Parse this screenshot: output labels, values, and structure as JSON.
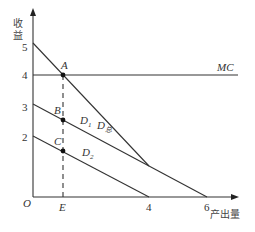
{
  "diagram": {
    "y_axis_label": [
      "收",
      "益"
    ],
    "x_axis_label": "产出量",
    "origin_label": "O",
    "y_ticks": [
      {
        "label": "5",
        "value": 5
      },
      {
        "label": "4",
        "value": 4
      },
      {
        "label": "3",
        "value": 3
      },
      {
        "label": "2",
        "value": 2
      }
    ],
    "x_ticks": [
      {
        "label": "E",
        "value": 1
      },
      {
        "label": "4",
        "value": 4
      },
      {
        "label": "6",
        "value": 6
      }
    ],
    "lines": {
      "mc": {
        "label": "MC",
        "from": [
          0,
          4
        ],
        "to": [
          7,
          4
        ]
      },
      "d_total": {
        "label": "D",
        "sub": "总",
        "from": [
          0,
          5.2
        ],
        "to": [
          3.7,
          1.6
        ]
      },
      "d1": {
        "label": "D",
        "sub": "1",
        "from": [
          0,
          3.1
        ],
        "to": [
          6,
          0
        ]
      },
      "d2": {
        "label": "D",
        "sub": "2",
        "from": [
          0,
          2.1
        ],
        "to": [
          4,
          0
        ]
      }
    },
    "points": [
      {
        "label": "A",
        "x": 1,
        "y": 4
      },
      {
        "label": "B",
        "x": 1,
        "y": 2.6
      },
      {
        "label": "C",
        "x": 1,
        "y": 1.6
      }
    ],
    "guide": {
      "x": 1,
      "style": "dashed"
    }
  }
}
